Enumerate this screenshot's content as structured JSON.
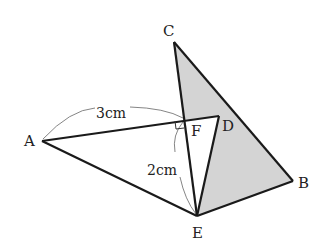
{
  "diagram": {
    "points": {
      "A": {
        "label": "A",
        "x": 42,
        "y": 141,
        "lx": 31,
        "ly": 146
      },
      "B": {
        "label": "B",
        "x": 293,
        "y": 181,
        "lx": 301,
        "ly": 188
      },
      "C": {
        "label": "C",
        "x": 174,
        "y": 42,
        "lx": 168,
        "ly": 36
      },
      "D": {
        "label": "D",
        "x": 219,
        "y": 116,
        "lx": 225,
        "ly": 130
      },
      "E": {
        "label": "E",
        "x": 197,
        "y": 216,
        "lx": 193,
        "ly": 238
      },
      "F": {
        "label": "F",
        "x": 183,
        "y": 120,
        "lx": 191,
        "ly": 135
      }
    },
    "shaded_region_color": "#d4d4d4",
    "line_color": "#1a1a1a",
    "dimensions": {
      "AF": {
        "label": "3cm"
      },
      "FE": {
        "label": "2cm"
      }
    },
    "right_angle_at": "F"
  }
}
